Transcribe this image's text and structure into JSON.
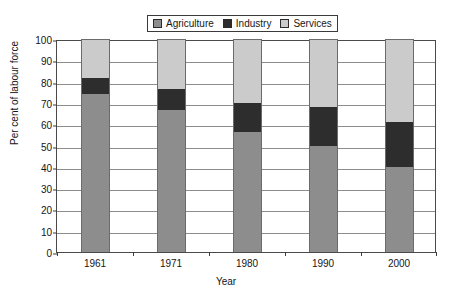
{
  "chart_data": {
    "type": "bar",
    "stacked": true,
    "title": "",
    "xlabel": "Year",
    "ylabel": "Per cent of labour force",
    "categories": [
      "1961",
      "1971",
      "1980",
      "1990",
      "2000"
    ],
    "ylim": [
      0,
      100
    ],
    "yticks": [
      0,
      10,
      20,
      30,
      40,
      50,
      60,
      70,
      80,
      90,
      100
    ],
    "grid": true,
    "legend_position": "top-center",
    "series": [
      {
        "name": "Agriculture",
        "color": "#8d8d8d",
        "values": [
          74,
          66.5,
          56.5,
          50,
          40
        ]
      },
      {
        "name": "Industry",
        "color": "#2d2d2d",
        "values": [
          7.5,
          10,
          13.5,
          18,
          21
        ]
      },
      {
        "name": "Services",
        "color": "#cbcbcb",
        "values": [
          18.5,
          23.5,
          30,
          32,
          39
        ]
      }
    ],
    "cumulative_tops": {
      "agriculture": [
        74,
        66.5,
        56.5,
        50,
        40
      ],
      "industry": [
        81.5,
        76.5,
        70,
        68,
        61
      ],
      "services": [
        100,
        100,
        100,
        100,
        100
      ]
    }
  },
  "legend": {
    "entries": [
      {
        "label": "Agriculture",
        "color": "#8d8d8d"
      },
      {
        "label": "Industry",
        "color": "#2d2d2d"
      },
      {
        "label": "Services",
        "color": "#cbcbcb"
      }
    ]
  },
  "axes": {
    "y_title": "Per cent of labour force",
    "x_title": "Year",
    "y_tick_labels": [
      "100",
      "90",
      "80",
      "70",
      "60",
      "50",
      "40",
      "30",
      "20",
      "10",
      "0"
    ],
    "x_tick_labels": [
      "1961",
      "1971",
      "1980",
      "1990",
      "2000"
    ]
  }
}
